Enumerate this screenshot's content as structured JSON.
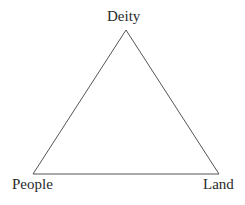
{
  "diagram": {
    "type": "triangle",
    "nodes": [
      {
        "id": "deity",
        "label": "Deity",
        "position": "top"
      },
      {
        "id": "people",
        "label": "People",
        "position": "bottom-left"
      },
      {
        "id": "land",
        "label": "Land",
        "position": "bottom-right"
      }
    ],
    "edges": [
      {
        "from": "deity",
        "to": "people"
      },
      {
        "from": "deity",
        "to": "land"
      },
      {
        "from": "people",
        "to": "land"
      }
    ],
    "line_color": "#555555"
  }
}
